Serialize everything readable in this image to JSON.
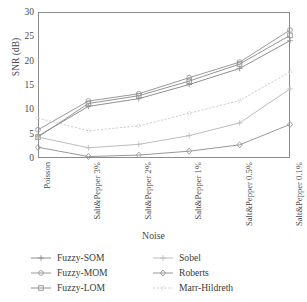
{
  "chart_data": {
    "type": "line",
    "title": "",
    "xlabel": "Noise",
    "ylabel": "SNR (dB)",
    "categories": [
      "Poisson",
      "Salt&Pepper 3%",
      "Salt&Pepper 2%",
      "Salt&Pepper 1%",
      "Salt&Pepper 0.5%",
      "Salt&Pepper 0.1%"
    ],
    "ylim": [
      0,
      30
    ],
    "yticks": [
      0,
      5,
      10,
      15,
      20,
      25,
      30
    ],
    "grid": false,
    "legend_position": "below",
    "series": [
      {
        "name": "Fuzzy-SOM",
        "marker": "plus",
        "color": "#8f8f8f",
        "values": [
          4.5,
          10.6,
          12.2,
          15.1,
          18.4,
          24.1
        ]
      },
      {
        "name": "Fuzzy-MOM",
        "marker": "circle",
        "color": "#9a9a9a",
        "values": [
          5.8,
          11.7,
          13.2,
          16.5,
          19.7,
          26.3
        ]
      },
      {
        "name": "Fuzzy-LOM",
        "marker": "square",
        "color": "#949494",
        "values": [
          4.3,
          11.2,
          12.8,
          15.8,
          19.3,
          25.2
        ]
      },
      {
        "name": "Sobel",
        "marker": "plus",
        "color": "#bdbdbd",
        "values": [
          4.3,
          2.1,
          2.8,
          4.6,
          7.2,
          14.2
        ]
      },
      {
        "name": "Roberts",
        "marker": "diamond",
        "color": "#999999",
        "values": [
          2.2,
          0.3,
          0.6,
          1.4,
          2.7,
          6.9
        ]
      },
      {
        "name": "Marr-Hildreth",
        "marker": "dotted",
        "color": "#cfcfcf",
        "values": [
          8.2,
          5.6,
          6.6,
          9.2,
          11.8,
          17.7
        ]
      }
    ]
  }
}
